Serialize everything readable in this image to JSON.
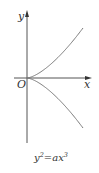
{
  "diagram": {
    "equation": {
      "base1": "y",
      "exp1": "2",
      "eq": "=ax",
      "exp2": "3"
    },
    "axes": {
      "x_label": "x",
      "y_label": "y",
      "origin_label": "O"
    },
    "curve": {
      "name": "cusp curve y^2 = a x^3",
      "a": 1,
      "branches": [
        "upper",
        "lower"
      ]
    },
    "colors": {
      "axis": "#555555",
      "curve": "#7a7a7a",
      "text": "#333333"
    }
  }
}
